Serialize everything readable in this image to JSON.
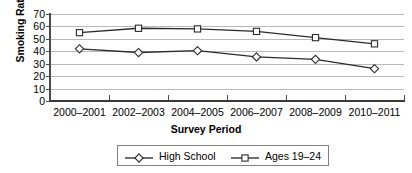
{
  "chart_data": {
    "type": "line",
    "title": "",
    "xlabel": "Survey Period",
    "ylabel": "Smoking Rate",
    "categories": [
      "2000–2001",
      "2002–2003",
      "2004–2005",
      "2006–2007",
      "2008–2009",
      "2010–2011"
    ],
    "ylim": [
      0,
      70
    ],
    "yticks": [
      0,
      10,
      20,
      30,
      40,
      50,
      60,
      70
    ],
    "grid": true,
    "legend_position": "bottom",
    "series": [
      {
        "name": "High School",
        "marker": "diamond",
        "color": "#000000",
        "values": [
          42,
          39,
          40.5,
          35.5,
          33.5,
          26
        ]
      },
      {
        "name": "Ages 19–24",
        "marker": "square",
        "color": "#000000",
        "values": [
          55,
          58.5,
          58,
          56,
          51,
          46
        ]
      }
    ]
  },
  "axis": {
    "y_title": "Smoking Rate",
    "x_title": "Survey Period",
    "y_tick_labels": [
      "70",
      "60",
      "50",
      "40",
      "30",
      "20",
      "10",
      "0"
    ],
    "x_tick_labels": [
      "2000–2001",
      "2002–2003",
      "2004–2005",
      "2006–2007",
      "2008–2009",
      "2010–2011"
    ]
  },
  "legend": {
    "entries": [
      {
        "label": "High School",
        "marker": "diamond"
      },
      {
        "label": "Ages 19–24",
        "marker": "square"
      }
    ]
  },
  "colors": {
    "line": "#2b2b2b",
    "grid": "#b9b9b9",
    "axis": "#444444",
    "marker_fill": "#ffffff",
    "text": "#000000"
  }
}
